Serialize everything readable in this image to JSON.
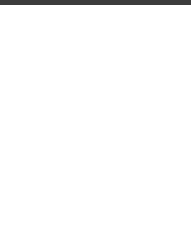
{
  "grid": {
    "columns_x": [
      22,
      51,
      80,
      109,
      137,
      166
    ],
    "rows_y": [
      33,
      75,
      112,
      150,
      188,
      223
    ],
    "line_color": "#9a9a9a"
  },
  "dot_color": "#555555",
  "square_color": "#888888",
  "markers": [
    {
      "type": "dot",
      "col": 0,
      "y": 54
    },
    {
      "type": "dot",
      "col": 2,
      "y": 54
    },
    {
      "type": "dot",
      "col": 5,
      "y": 54
    },
    {
      "type": "dot",
      "col": 1,
      "y": 93
    },
    {
      "type": "dot",
      "col": 3,
      "y": 93
    },
    {
      "type": "dot",
      "col": 0,
      "y": 130
    },
    {
      "type": "square",
      "col": 1,
      "y": 130
    },
    {
      "type": "dot",
      "col": 2,
      "y": 130
    },
    {
      "type": "dot",
      "col": 4,
      "y": 130
    },
    {
      "type": "dot",
      "col": 5,
      "y": 130
    },
    {
      "type": "dot",
      "col": 3,
      "y": 168
    },
    {
      "type": "dot",
      "col": 4,
      "y": 168
    },
    {
      "type": "dot",
      "col": 0,
      "y": 205
    },
    {
      "type": "dot",
      "col": 1,
      "y": 205
    },
    {
      "type": "dot",
      "col": 2,
      "y": 205
    },
    {
      "type": "square",
      "col": 3,
      "y": 205
    },
    {
      "type": "dot",
      "col": 5,
      "y": 205
    }
  ],
  "price_label": "2 fr"
}
